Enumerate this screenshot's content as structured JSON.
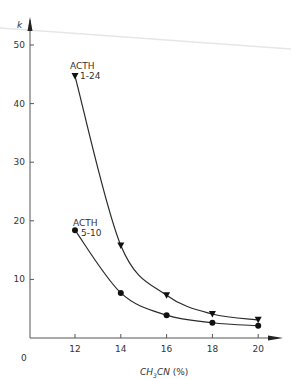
{
  "chart_data": {
    "type": "line",
    "title": "",
    "xlabel": "CH3CN (%)",
    "xlabel_parts": {
      "pre": "CH",
      "sub": "3",
      "post": "CN",
      "unit": "(%)"
    },
    "ylabel": "k",
    "x": [
      12,
      14,
      16,
      18,
      20
    ],
    "xlim": [
      10.1,
      21.5
    ],
    "ylim": [
      0,
      52
    ],
    "x_ticks": [
      12,
      14,
      16,
      18,
      20
    ],
    "y_ticks": [
      10,
      20,
      30,
      40,
      50
    ],
    "origin_label": "0",
    "grid": false,
    "legend": "inline annotations",
    "series": [
      {
        "name": "ACTH 1-24",
        "label_line1": "ACTH",
        "label_line2": "1-24",
        "marker": "down-triangle",
        "values": [
          44.7,
          15.8,
          7.3,
          4.1,
          3.1
        ]
      },
      {
        "name": "ACTH 5-10",
        "label_line1": "ACTH",
        "label_line2": "5-10",
        "marker": "circle",
        "values": [
          18.4,
          7.7,
          3.9,
          2.6,
          2.1
        ]
      }
    ]
  },
  "colors": {
    "ink": "#2a2a2a",
    "axis": "#555555",
    "artifact": "#e6e6e6"
  }
}
